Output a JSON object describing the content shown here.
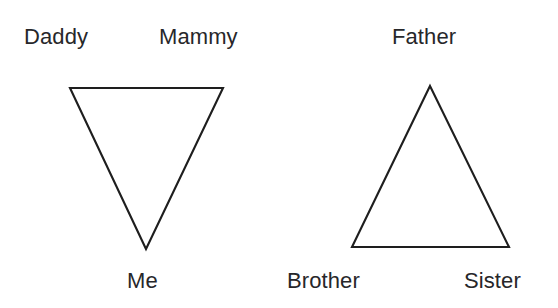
{
  "figure": {
    "background_color": "#ffffff",
    "stroke_color": "#1e1e1e",
    "text_color": "#27272a",
    "width": 558,
    "height": 308
  },
  "diagrams": [
    {
      "id": "left-triangle",
      "orientation": "inverted",
      "points": "70,88 223,88 146,249",
      "labels": {
        "top_left": "Daddy",
        "top_right": "Mammy",
        "bottom": "Me"
      }
    },
    {
      "id": "right-triangle",
      "orientation": "upright",
      "points": "430,86 509,247 352,247",
      "labels": {
        "top": "Father",
        "bottom_left": "Brother",
        "bottom_right": "Sister"
      }
    }
  ]
}
